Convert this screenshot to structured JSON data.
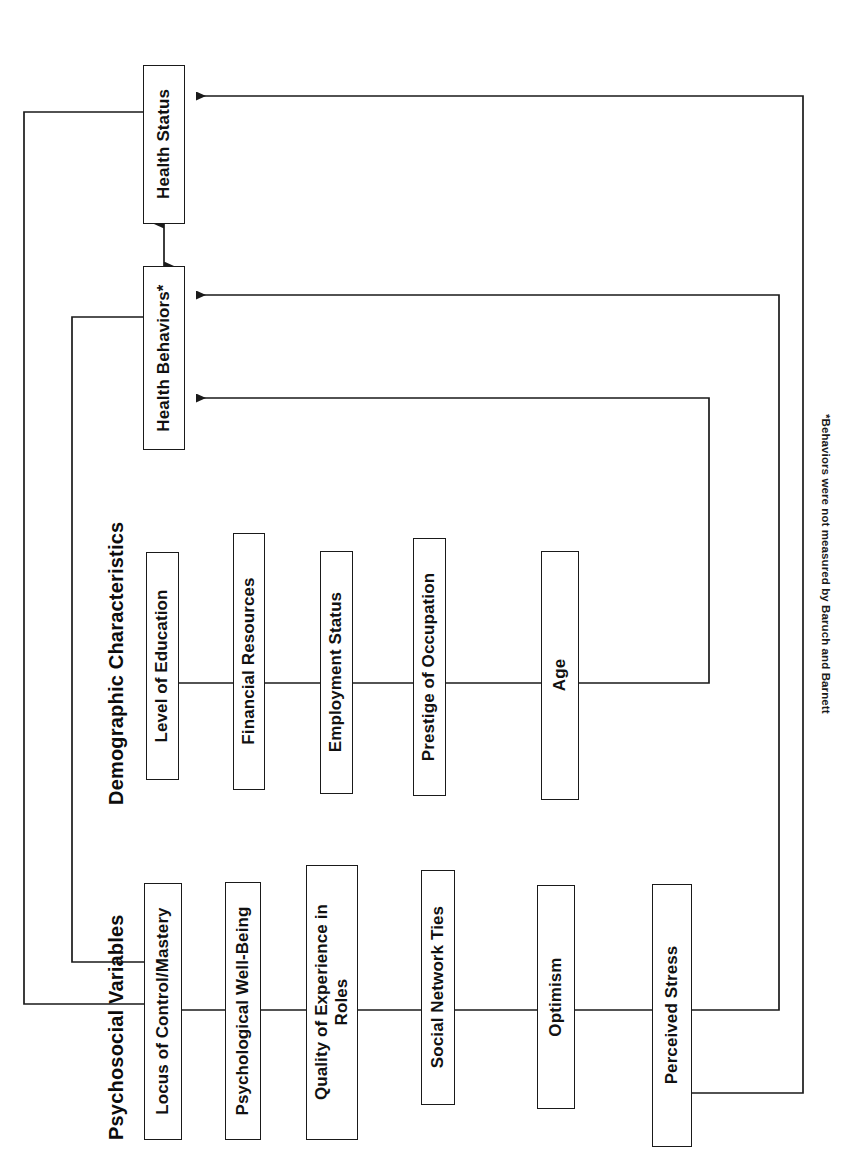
{
  "figure": {
    "orientation": "rotated-90-counterclockwise",
    "background_color": "#ffffff",
    "line_color": "#1a1a1a",
    "text_color": "#111111"
  },
  "groups": [
    {
      "id": "psychosocial",
      "title": "Psychosocial Variables"
    },
    {
      "id": "demographic",
      "title": "Demographic Characteristics"
    }
  ],
  "outcomes": [
    {
      "id": "health-status",
      "label": "Health Status"
    },
    {
      "id": "health-behaviors",
      "label": "Health Behaviors*"
    }
  ],
  "psychosocial_variables": [
    {
      "id": "locus-of-control-mastery",
      "label": "Locus of Control/Mastery"
    },
    {
      "id": "psychological-well-being",
      "label": "Psychological Well-Being"
    },
    {
      "id": "quality-of-experience-in-roles",
      "label": "Quality of Experience in\nRoles"
    },
    {
      "id": "social-network-ties",
      "label": "Social Network Ties"
    },
    {
      "id": "optimism",
      "label": "Optimism"
    },
    {
      "id": "perceived-stress",
      "label": "Perceived Stress"
    }
  ],
  "demographic_characteristics": [
    {
      "id": "level-of-education",
      "label": "Level of Education"
    },
    {
      "id": "financial-resources",
      "label": "Financial Resources"
    },
    {
      "id": "employment-status",
      "label": "Employment Status"
    },
    {
      "id": "prestige-of-occupation",
      "label": "Prestige of Occupation"
    },
    {
      "id": "age",
      "label": "Age"
    }
  ],
  "footnote": {
    "text": "*Behaviors were not measured by Baruch and Barnett"
  },
  "connections": [
    {
      "id": "behaviors-status-bidirectional",
      "from": "health-behaviors",
      "to": "health-status",
      "type": "double-arrow"
    },
    {
      "id": "demographic-to-behaviors",
      "from": "demographic-spine",
      "to": "health-behaviors",
      "type": "arrow"
    },
    {
      "id": "psychosocial-to-behaviors",
      "from": "psychosocial-spine",
      "to": "health-behaviors",
      "type": "arrow"
    },
    {
      "id": "psychosocial-to-status",
      "from": "psychosocial-spine",
      "to": "health-status",
      "type": "arrow"
    },
    {
      "id": "status-feedback-to-psychosocial",
      "from": "health-status",
      "to": "psychosocial-group",
      "type": "arrow"
    },
    {
      "id": "behaviors-feedback-to-psychosocial",
      "from": "health-behaviors",
      "to": "psychosocial-group",
      "type": "arrow"
    }
  ]
}
